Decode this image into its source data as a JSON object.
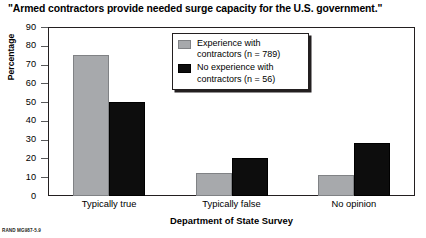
{
  "chart_data": {
    "type": "bar",
    "title": "\"Armed contractors provide needed surge capacity for the U.S. government.\"",
    "xlabel": "Department of State Survey",
    "ylabel": "Percentage",
    "ylim": [
      0,
      90
    ],
    "yticks": [
      90,
      80,
      70,
      60,
      50,
      40,
      30,
      20,
      10,
      0
    ],
    "grid": false,
    "legend_position": "upper-center",
    "categories": [
      "Typically true",
      "Typically false",
      "No opinion"
    ],
    "series": [
      {
        "name": "Experience with\ncontractors (n = 789)",
        "color": "#a7a9ac",
        "values": [
          75,
          12,
          11
        ]
      },
      {
        "name": "No experience with\ncontractors (n = 56)",
        "color": "#0d0d0d",
        "values": [
          50,
          20,
          28
        ]
      }
    ],
    "footnote": "RAND MG987-5.9"
  }
}
